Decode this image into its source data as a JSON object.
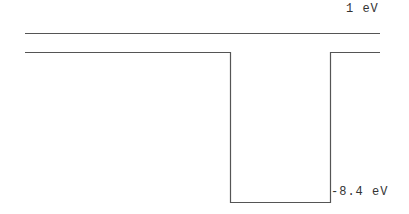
{
  "diagram": {
    "type": "potential-well",
    "top_level_label": "1 eV",
    "well_bottom_label": "-8.4 eV",
    "line_color": "#555555",
    "text_color": "#333333"
  }
}
